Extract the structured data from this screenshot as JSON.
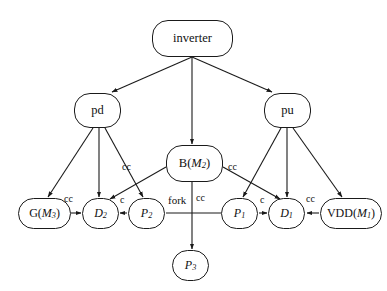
{
  "diagram": {
    "background": "#ffffff",
    "stroke_color": "#1a1a1a",
    "text_color": "#111111",
    "width": 387,
    "height": 291,
    "nodes": [
      {
        "id": "inverter",
        "label": "inverter",
        "html": "inverter",
        "x": 152,
        "y": 20,
        "w": 81,
        "h": 37,
        "font_size": 12.5
      },
      {
        "id": "pd",
        "label": "pd",
        "html": "pd",
        "x": 74,
        "y": 93,
        "w": 47,
        "h": 35,
        "font_size": 12.5
      },
      {
        "id": "pu",
        "label": "pu",
        "html": "pu",
        "x": 264,
        "y": 93,
        "w": 47,
        "h": 35,
        "font_size": 12.5
      },
      {
        "id": "bm2",
        "label": "B(M2)",
        "html": "B(<span class=\"it\">M</span><sub>2</sub>)",
        "x": 166,
        "y": 145,
        "w": 57,
        "h": 37,
        "font_size": 12.5
      },
      {
        "id": "gm3",
        "label": "G(M3)",
        "html": "G(<span class=\"it\">M</span><sub>3</sub>)",
        "x": 18,
        "y": 198,
        "w": 53,
        "h": 31,
        "font_size": 12
      },
      {
        "id": "d2",
        "label": "D2",
        "html": "<span class=\"it\">D</span><sub>2</sub>",
        "x": 82,
        "y": 198,
        "w": 37,
        "h": 31,
        "font_size": 12
      },
      {
        "id": "p2",
        "label": "P2",
        "html": "<span class=\"it\">P</span><sub>2</sub>",
        "x": 128,
        "y": 198,
        "w": 37,
        "h": 31,
        "font_size": 12
      },
      {
        "id": "p1",
        "label": "P1",
        "html": "<span class=\"it\">P</span><sub>1</sub>",
        "x": 221,
        "y": 198,
        "w": 37,
        "h": 31,
        "font_size": 12
      },
      {
        "id": "d1",
        "label": "D1",
        "html": "<span class=\"it\">D</span><sub>1</sub>",
        "x": 268,
        "y": 198,
        "w": 37,
        "h": 31,
        "font_size": 12
      },
      {
        "id": "vdd",
        "label": "VDD(M1)",
        "html": "VDD(<span class=\"it\">M</span><sub>1</sub>)",
        "x": 320,
        "y": 198,
        "w": 62,
        "h": 31,
        "font_size": 12
      },
      {
        "id": "p3",
        "label": "P3",
        "html": "<span class=\"it\">P</span><sub>3</sub>",
        "x": 172,
        "y": 250,
        "w": 37,
        "h": 31,
        "font_size": 12
      }
    ],
    "edges": [
      {
        "id": "inverter-pd",
        "from": "inverter",
        "to": "pd",
        "label": "",
        "x1": 192,
        "y1": 57,
        "x2": 112,
        "y2": 92,
        "arrow": true
      },
      {
        "id": "inverter-bm2",
        "from": "inverter",
        "to": "bm2",
        "label": "",
        "x1": 192,
        "y1": 57,
        "x2": 192,
        "y2": 144,
        "arrow": true
      },
      {
        "id": "inverter-pu",
        "from": "inverter",
        "to": "pu",
        "label": "",
        "x1": 192,
        "y1": 57,
        "x2": 272,
        "y2": 92,
        "arrow": true
      },
      {
        "id": "pd-gm3",
        "from": "pd",
        "to": "gm3",
        "label": "",
        "x1": 93,
        "y1": 128,
        "x2": 48,
        "y2": 197,
        "arrow": true
      },
      {
        "id": "pd-d2",
        "from": "pd",
        "to": "d2",
        "label": "",
        "x1": 99,
        "y1": 128,
        "x2": 99,
        "y2": 197,
        "arrow": true
      },
      {
        "id": "pd-p2",
        "from": "pd",
        "to": "p2",
        "label": "",
        "x1": 105,
        "y1": 128,
        "x2": 143,
        "y2": 197,
        "arrow": true
      },
      {
        "id": "pu-p1",
        "from": "pu",
        "to": "p1",
        "label": "",
        "x1": 281,
        "y1": 128,
        "x2": 243,
        "y2": 197,
        "arrow": true
      },
      {
        "id": "pu-d1",
        "from": "pu",
        "to": "d1",
        "label": "",
        "x1": 287,
        "y1": 128,
        "x2": 287,
        "y2": 197,
        "arrow": true
      },
      {
        "id": "pu-vdd",
        "from": "pu",
        "to": "vdd",
        "label": "",
        "x1": 293,
        "y1": 128,
        "x2": 342,
        "y2": 197,
        "arrow": true
      },
      {
        "id": "bm2-d2",
        "from": "bm2",
        "to": "d2",
        "label": "cc",
        "x1": 166,
        "y1": 167,
        "x2": 110,
        "y2": 199,
        "arrow": true
      },
      {
        "id": "bm2-d1",
        "from": "bm2",
        "to": "d1",
        "label": "cc",
        "x1": 223,
        "y1": 167,
        "x2": 280,
        "y2": 199,
        "arrow": true
      },
      {
        "id": "bm2-p3",
        "from": "bm2",
        "to": "p3",
        "label": "cc",
        "x1": 192,
        "y1": 182,
        "x2": 192,
        "y2": 249,
        "arrow": true
      },
      {
        "id": "gm3-d2",
        "from": "gm3",
        "to": "d2",
        "label": "cc",
        "x1": 71,
        "y1": 213,
        "x2": 81,
        "y2": 213,
        "arrow": true
      },
      {
        "id": "p2-d2",
        "from": "p2",
        "to": "d2",
        "label": "c",
        "x1": 127,
        "y1": 213,
        "x2": 120,
        "y2": 213,
        "arrow": true
      },
      {
        "id": "p1-p2",
        "from": "p1",
        "to": "p2",
        "label": "fork",
        "x1": 221,
        "y1": 213,
        "x2": 166,
        "y2": 213,
        "arrow": false
      },
      {
        "id": "p1-d1",
        "from": "p1",
        "to": "d1",
        "label": "c",
        "x1": 259,
        "y1": 213,
        "x2": 267,
        "y2": 213,
        "arrow": true
      },
      {
        "id": "vdd-d1",
        "from": "vdd",
        "to": "d1",
        "label": "cc",
        "x1": 319,
        "y1": 213,
        "x2": 307,
        "y2": 213,
        "arrow": true
      }
    ],
    "edge_labels": [
      {
        "id": "label-bm2-d2",
        "text": "cc",
        "x": 122,
        "y": 162,
        "font_size": 10
      },
      {
        "id": "label-bm2-d1",
        "text": "cc",
        "x": 228,
        "y": 162,
        "font_size": 10
      },
      {
        "id": "label-gm3-d2",
        "text": "cc",
        "x": 64,
        "y": 194,
        "font_size": 10
      },
      {
        "id": "label-p2-d2",
        "text": "c",
        "x": 120,
        "y": 195,
        "font_size": 10
      },
      {
        "id": "label-fork",
        "text": "fork",
        "x": 168,
        "y": 195,
        "font_size": 11
      },
      {
        "id": "label-bm2-p3",
        "text": "cc",
        "x": 196,
        "y": 193,
        "font_size": 10
      },
      {
        "id": "label-p1-d1",
        "text": "c",
        "x": 260,
        "y": 195,
        "font_size": 10
      },
      {
        "id": "label-vdd-d1",
        "text": "cc",
        "x": 306,
        "y": 194,
        "font_size": 10
      }
    ]
  }
}
